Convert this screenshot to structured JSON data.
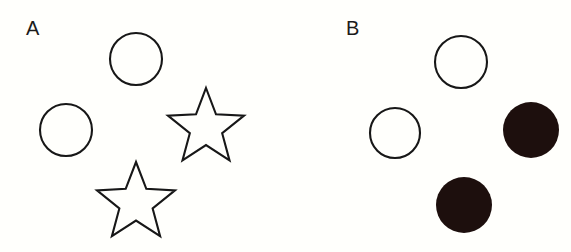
{
  "figure": {
    "background_color": "#fffffc",
    "width": 571,
    "height": 252,
    "outline_color": "#171717",
    "fill_color": "#1d0f0d",
    "panel_count": 2
  },
  "panels": [
    {
      "id": "panel-a",
      "label": "A",
      "label_x": 26,
      "label_y": 18,
      "origin_x": 0,
      "width": 285,
      "shape_summary": "two outlined circles and two outlined stars",
      "shapes": [
        {
          "name": "circle-top",
          "type": "circle",
          "style": "outline",
          "cx": 136,
          "cy": 59,
          "r": 26,
          "color": "#171717"
        },
        {
          "name": "circle-left",
          "type": "circle",
          "style": "outline",
          "cx": 66,
          "cy": 130,
          "r": 26,
          "color": "#171717"
        },
        {
          "name": "star-right",
          "type": "star",
          "style": "outline",
          "cx": 206,
          "cy": 128,
          "outer_r": 40,
          "inner_r": 17,
          "points": 5,
          "rotation_deg": -90,
          "color": "#171717"
        },
        {
          "name": "star-bottom",
          "type": "star",
          "style": "outline",
          "cx": 136,
          "cy": 203,
          "outer_r": 41,
          "inner_r": 17.5,
          "points": 5,
          "rotation_deg": -90,
          "color": "#171717"
        }
      ]
    },
    {
      "id": "panel-b",
      "label": "B",
      "label_x": 61,
      "label_y": 18,
      "origin_x": 285,
      "width": 286,
      "shape_summary": "two outlined circles and two solid black circles",
      "shapes": [
        {
          "name": "circle-top",
          "type": "circle",
          "style": "outline",
          "cx": 176,
          "cy": 62,
          "r": 26,
          "color": "#171717"
        },
        {
          "name": "circle-left",
          "type": "circle",
          "style": "outline",
          "cx": 110,
          "cy": 133,
          "r": 25,
          "color": "#171717"
        },
        {
          "name": "disc-right",
          "type": "circle",
          "style": "filled",
          "cx": 246,
          "cy": 130,
          "r": 28,
          "color": "#1d0f0d"
        },
        {
          "name": "disc-bottom",
          "type": "circle",
          "style": "filled",
          "cx": 179,
          "cy": 205,
          "r": 28,
          "color": "#1d0f0d"
        }
      ]
    }
  ]
}
